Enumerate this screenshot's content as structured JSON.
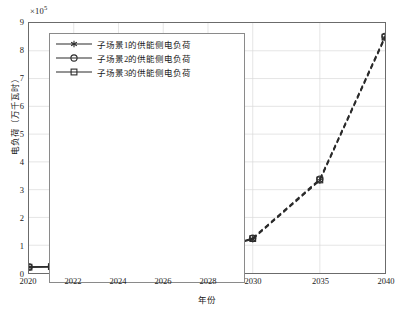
{
  "chart_data": {
    "type": "line",
    "title": "",
    "xlabel": "年份",
    "ylabel": "电负荷（万千瓦时）",
    "y_multiplier_text": "×10",
    "y_multiplier_exponent": "5",
    "y_scale": 100000,
    "xlim": [
      2020,
      2040
    ],
    "ylim": [
      0,
      9
    ],
    "grid": true,
    "legend_position": "upper-left",
    "y_ticks": [
      0,
      1,
      2,
      3,
      4,
      5,
      6,
      7,
      8,
      9
    ],
    "y_tick_labels": [
      "0",
      "1",
      "2",
      "3",
      "4",
      "5",
      "6",
      "7",
      "8",
      "9"
    ],
    "x_ticks": [
      2020,
      2022,
      2024,
      2026,
      2028,
      2030,
      2035,
      2040
    ],
    "x_tick_labels": [
      "2020",
      "2022",
      "2024",
      "2026",
      "2028",
      "2030",
      "2035",
      "2040"
    ],
    "x": [
      2020,
      2021,
      2022,
      2023,
      2024,
      2025,
      2026,
      2027,
      2028,
      2029,
      2030,
      2035,
      2040
    ],
    "series": [
      {
        "name": "子场景1的供能侧电负荷",
        "marker": "asterisk-marker",
        "color": "#2b2b2b",
        "values": [
          0.21,
          0.22,
          0.24,
          0.28,
          0.33,
          0.41,
          0.51,
          0.64,
          0.79,
          0.98,
          1.22,
          3.33,
          8.46
        ]
      },
      {
        "name": "子场景2的供能侧电负荷",
        "marker": "circle-marker",
        "color": "#2b2b2b",
        "values": [
          0.22,
          0.23,
          0.26,
          0.3,
          0.36,
          0.44,
          0.55,
          0.68,
          0.84,
          1.02,
          1.26,
          3.38,
          8.52
        ]
      },
      {
        "name": "子场景3的供能侧电负荷",
        "marker": "square-marker",
        "color": "#2b2b2b",
        "values": [
          0.21,
          0.23,
          0.25,
          0.29,
          0.35,
          0.43,
          0.53,
          0.66,
          0.82,
          1.0,
          1.24,
          3.35,
          8.49
        ]
      }
    ],
    "line_styles": {
      "solid_range": [
        2020,
        2030
      ],
      "dashed_range": [
        2030,
        2040
      ]
    },
    "colors": {
      "line": "#2b2b2b",
      "grid": "#d9d9d9",
      "frame": "#6b6b6b",
      "background": "#ffffff"
    }
  }
}
